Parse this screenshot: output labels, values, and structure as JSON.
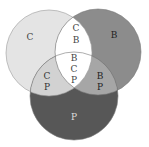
{
  "diagram": {
    "type": "venn-3",
    "sets": [
      {
        "id": "C",
        "label": "C",
        "color": "#e4e4e4"
      },
      {
        "id": "B",
        "label": "B",
        "color": "#8c8c8c"
      },
      {
        "id": "P",
        "label": "P",
        "color": "#575757"
      }
    ],
    "regions": {
      "c_only": [
        "C"
      ],
      "b_only": [
        "B"
      ],
      "p_only": [
        "P"
      ],
      "cb": [
        "C",
        "B"
      ],
      "cp": [
        "C",
        "P"
      ],
      "bp": [
        "B",
        "P"
      ],
      "cbp": [
        "B",
        "C",
        "P"
      ]
    },
    "colors": {
      "c_only": "#e4e4e4",
      "b_only": "#8c8c8c",
      "p_only": "#575757",
      "cb": "#ffffff",
      "cp": "#d2d2d2",
      "bp": "#a6a6a6",
      "cbp": "#ffffff"
    }
  }
}
